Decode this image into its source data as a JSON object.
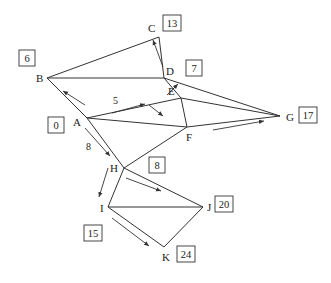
{
  "diagram": {
    "type": "network-graph",
    "nodes": [
      {
        "id": "A",
        "label": "A",
        "x": 87,
        "y": 118,
        "lx": 73,
        "ly": 126,
        "value": "0",
        "bx": 48,
        "by": 117
      },
      {
        "id": "B",
        "label": "B",
        "x": 47,
        "y": 78,
        "lx": 36,
        "ly": 82,
        "value": "6",
        "bx": 19,
        "by": 50
      },
      {
        "id": "C",
        "label": "C",
        "x": 159,
        "y": 37,
        "lx": 148,
        "ly": 32,
        "value": "13",
        "bx": 163,
        "by": 15
      },
      {
        "id": "D",
        "label": "D",
        "x": 164,
        "y": 78,
        "lx": 166,
        "ly": 75,
        "value": "7",
        "bx": 186,
        "by": 60
      },
      {
        "id": "E",
        "label": "E",
        "x": 181,
        "y": 98,
        "lx": 168,
        "ly": 95,
        "value": "",
        "bx": 0,
        "by": 0
      },
      {
        "id": "F",
        "label": "F",
        "x": 187,
        "y": 127,
        "lx": 186,
        "ly": 141,
        "value": "",
        "bx": 0,
        "by": 0
      },
      {
        "id": "G",
        "label": "G",
        "x": 280,
        "y": 116,
        "lx": 286,
        "ly": 121,
        "value": "17",
        "bx": 299,
        "by": 107
      },
      {
        "id": "H",
        "label": "H",
        "x": 124,
        "y": 168,
        "lx": 110,
        "ly": 172,
        "value": "8",
        "bx": 149,
        "by": 157
      },
      {
        "id": "I",
        "label": "I",
        "x": 108,
        "y": 207,
        "lx": 100,
        "ly": 212,
        "value": "15",
        "bx": 84,
        "by": 225
      },
      {
        "id": "J",
        "label": "J",
        "x": 203,
        "y": 207,
        "lx": 207,
        "ly": 211,
        "value": "20",
        "bx": 215,
        "by": 196
      },
      {
        "id": "K",
        "label": "K",
        "x": 164,
        "y": 247,
        "lx": 162,
        "ly": 261,
        "value": "24",
        "bx": 177,
        "by": 246
      }
    ],
    "edges": [
      {
        "from": "B",
        "to": "C"
      },
      {
        "from": "B",
        "to": "D"
      },
      {
        "from": "C",
        "to": "D"
      },
      {
        "from": "B",
        "to": "A"
      },
      {
        "from": "A",
        "to": "E",
        "weight": "5"
      },
      {
        "from": "A",
        "to": "F"
      },
      {
        "from": "A",
        "to": "H",
        "weight": "8"
      },
      {
        "from": "D",
        "to": "E"
      },
      {
        "from": "D",
        "to": "G"
      },
      {
        "from": "E",
        "to": "G"
      },
      {
        "from": "E",
        "to": "F"
      },
      {
        "from": "F",
        "to": "G"
      },
      {
        "from": "F",
        "to": "H"
      },
      {
        "from": "H",
        "to": "I"
      },
      {
        "from": "H",
        "to": "J"
      },
      {
        "from": "I",
        "to": "J"
      },
      {
        "from": "I",
        "to": "K"
      },
      {
        "from": "J",
        "to": "K"
      }
    ],
    "edge_labels": [
      {
        "text": "5",
        "x": 113,
        "y": 104
      },
      {
        "text": "8",
        "x": 86,
        "y": 150
      }
    ],
    "arrows": [
      {
        "x1": 85,
        "y1": 105,
        "x2": 63,
        "y2": 91,
        "name": "arrow-A-to-B"
      },
      {
        "x1": 112,
        "y1": 113,
        "x2": 145,
        "y2": 104,
        "name": "arrow-A-to-E"
      },
      {
        "x1": 149,
        "y1": 105,
        "x2": 163,
        "y2": 116,
        "name": "arrow-E-to-F"
      },
      {
        "x1": 167,
        "y1": 95,
        "x2": 178,
        "y2": 84,
        "name": "arrow-E-to-D"
      },
      {
        "x1": 163,
        "y1": 67,
        "x2": 153,
        "y2": 40,
        "name": "arrow-D-to-C"
      },
      {
        "x1": 213,
        "y1": 130,
        "x2": 264,
        "y2": 121,
        "name": "arrow-F-to-G"
      },
      {
        "x1": 85,
        "y1": 128,
        "x2": 110,
        "y2": 156,
        "name": "arrow-A-to-H"
      },
      {
        "x1": 108,
        "y1": 168,
        "x2": 99,
        "y2": 197,
        "name": "arrow-H-to-I"
      },
      {
        "x1": 126,
        "y1": 178,
        "x2": 161,
        "y2": 191,
        "name": "arrow-H-to-J"
      },
      {
        "x1": 112,
        "y1": 218,
        "x2": 149,
        "y2": 246,
        "name": "arrow-I-to-K"
      }
    ],
    "styles": {
      "line_color": "#333333",
      "text_color": "#222222",
      "background": "#ffffff"
    }
  }
}
